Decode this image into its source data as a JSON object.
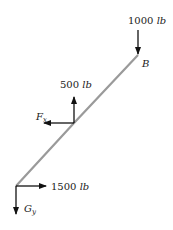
{
  "diagram": {
    "type": "free-body-diagram",
    "member": {
      "color": "#9a9a9a"
    },
    "points": {
      "B": {
        "label": "B"
      }
    },
    "forces": [
      {
        "id": "load_top",
        "value": "1000",
        "unit": "lb",
        "direction": "down",
        "at": "B"
      },
      {
        "id": "load_mid",
        "value": "500",
        "unit": "lb",
        "direction": "up",
        "at": "midpoint"
      },
      {
        "id": "reaction_fx",
        "symbol": "F",
        "subscript": "x",
        "direction": "left",
        "at": "midpoint"
      },
      {
        "id": "load_bottom",
        "value": "1500",
        "unit": "lb",
        "direction": "right",
        "at": "bottom"
      },
      {
        "id": "reaction_gy",
        "symbol": "G",
        "subscript": "y",
        "direction": "down",
        "at": "bottom"
      }
    ]
  }
}
